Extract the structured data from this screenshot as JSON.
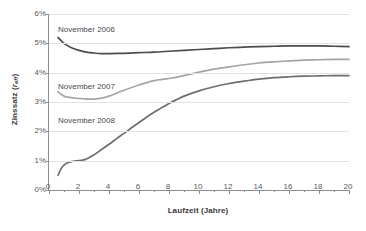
{
  "chart_data": {
    "type": "line",
    "title": "",
    "xlabel": "Laufzeit (Jahre)",
    "ylabel": "Zinssatz (r_eff)",
    "ylabel_main": "Zinssatz (",
    "ylabel_var": "r",
    "ylabel_sub": "eff",
    "ylabel_close": ")",
    "xlim": [
      0,
      20
    ],
    "ylim": [
      0,
      6
    ],
    "y_unit": "%",
    "grid": "horizontal",
    "legend": "inline-annotations",
    "x_tick_labels": [
      "0",
      "2",
      "4",
      "6",
      "8",
      "10",
      "12",
      "14",
      "16",
      "18",
      "20"
    ],
    "x_tick_values": [
      0,
      2,
      4,
      6,
      8,
      10,
      12,
      14,
      16,
      18,
      20
    ],
    "x_minor_tick_values": [
      1,
      3,
      5,
      7,
      9,
      11,
      13,
      15,
      17,
      19
    ],
    "y_tick_labels": [
      "0%",
      "1%",
      "2%",
      "3%",
      "4%",
      "5%",
      "6%"
    ],
    "y_tick_values": [
      0,
      1,
      2,
      3,
      4,
      5,
      6
    ],
    "series": [
      {
        "name": "November 2006",
        "color": "#4d4d4f",
        "label_x_px": 58,
        "label_y_px": 25,
        "x": [
          0.6,
          1,
          1.5,
          2,
          2.5,
          3,
          3.5,
          4,
          5,
          6,
          7,
          8,
          9,
          10,
          11,
          12,
          13,
          14,
          15,
          16,
          17,
          18,
          19,
          20
        ],
        "values": [
          5.2,
          5.0,
          4.85,
          4.76,
          4.7,
          4.67,
          4.65,
          4.65,
          4.66,
          4.68,
          4.7,
          4.73,
          4.76,
          4.79,
          4.82,
          4.85,
          4.87,
          4.89,
          4.9,
          4.91,
          4.91,
          4.91,
          4.9,
          4.89
        ]
      },
      {
        "name": "November 2007",
        "color": "#a5a5a7",
        "label_x_px": 58,
        "label_y_px": 82,
        "x": [
          0.6,
          1,
          1.5,
          2,
          2.5,
          3,
          3.5,
          4,
          4.5,
          5,
          6,
          7,
          8,
          9,
          10,
          11,
          12,
          13,
          14,
          15,
          16,
          17,
          18,
          19,
          20
        ],
        "values": [
          3.35,
          3.2,
          3.15,
          3.12,
          3.1,
          3.1,
          3.13,
          3.2,
          3.3,
          3.4,
          3.58,
          3.73,
          3.8,
          3.9,
          4.02,
          4.12,
          4.2,
          4.27,
          4.33,
          4.37,
          4.4,
          4.43,
          4.44,
          4.45,
          4.45
        ]
      },
      {
        "name": "November 2008",
        "color": "#6e6e70",
        "label_x_px": 58,
        "label_y_px": 116,
        "x": [
          0.6,
          0.8,
          1,
          1.25,
          1.5,
          1.75,
          2,
          2.25,
          2.5,
          3,
          3.5,
          4,
          4.5,
          5,
          5.5,
          6,
          6.5,
          7,
          7.5,
          8,
          8.5,
          9,
          10,
          11,
          12,
          13,
          14,
          15,
          16,
          17,
          18,
          19,
          20
        ],
        "values": [
          0.5,
          0.72,
          0.85,
          0.93,
          0.97,
          0.99,
          1.0,
          1.02,
          1.06,
          1.2,
          1.38,
          1.56,
          1.75,
          1.93,
          2.12,
          2.3,
          2.48,
          2.65,
          2.8,
          2.95,
          3.08,
          3.2,
          3.38,
          3.52,
          3.63,
          3.71,
          3.78,
          3.83,
          3.86,
          3.88,
          3.89,
          3.9,
          3.9
        ]
      }
    ]
  }
}
